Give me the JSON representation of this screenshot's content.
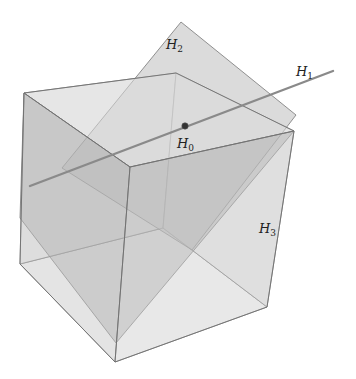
{
  "figure": {
    "labels": {
      "H0": {
        "main": "H",
        "sub": "0"
      },
      "H1": {
        "main": "H",
        "sub": "1"
      },
      "H2": {
        "main": "H",
        "sub": "2"
      },
      "H3": {
        "main": "H",
        "sub": "3"
      }
    },
    "colors": {
      "background": "#ffffff",
      "face_light": "#e6e6e6",
      "face_mid": "#cfcfcf",
      "face_dark": "#a9a9a9",
      "edge": "#6f6f6f",
      "line": "#8a8a8a",
      "point": "#333333"
    }
  }
}
